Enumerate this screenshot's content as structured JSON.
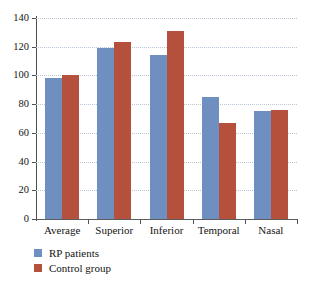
{
  "chart_data": {
    "type": "bar",
    "title": "",
    "xlabel": "",
    "ylabel": "",
    "categories": [
      "Average",
      "Superior",
      "Inferior",
      "Temporal",
      "Nasal"
    ],
    "series": [
      {
        "name": "RP patients",
        "color": "#6e8fbf",
        "values": [
          98,
          119,
          114,
          85,
          75
        ]
      },
      {
        "name": "Control group",
        "color": "#b4503c",
        "values": [
          100,
          123,
          131,
          67,
          76
        ]
      }
    ],
    "ylim": [
      0,
      140
    ],
    "ytick_values": [
      0,
      20,
      40,
      60,
      80,
      100,
      120,
      140
    ],
    "ytick_labels": [
      "0",
      "20",
      "40",
      "60",
      "80",
      "100",
      "120",
      "140"
    ],
    "grid": "horizontal-dotted",
    "legend_position": "bottom-left",
    "legend_orientation": "vertical"
  },
  "axes": {
    "y_ticks": [
      {
        "label": "140",
        "value": 140
      },
      {
        "label": "120",
        "value": 120
      },
      {
        "label": "100",
        "value": 100
      },
      {
        "label": "80",
        "value": 80
      },
      {
        "label": "60",
        "value": 60
      },
      {
        "label": "40",
        "value": 40
      },
      {
        "label": "20",
        "value": 20
      },
      {
        "label": "0",
        "value": 0
      }
    ]
  },
  "legend": {
    "items": [
      {
        "label": "RP patients",
        "swatch": "series-a"
      },
      {
        "label": "Control group",
        "swatch": "series-b"
      }
    ]
  }
}
